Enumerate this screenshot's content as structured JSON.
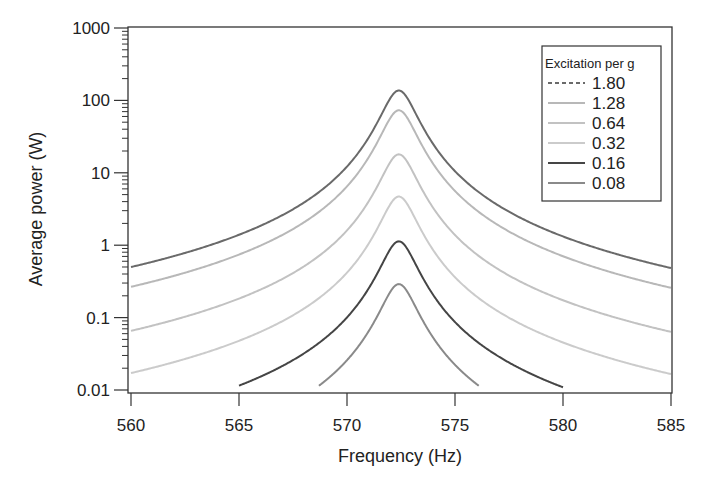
{
  "chart_data": {
    "type": "line",
    "title": "",
    "xlabel": "Frequency (Hz)",
    "ylabel": "Average power (W)",
    "xlim": [
      560,
      585
    ],
    "ylim": [
      0.01,
      1000
    ],
    "yscale": "log",
    "grid": false,
    "xticks": [
      560,
      565,
      570,
      575,
      580,
      585
    ],
    "xtick_labels": [
      "560",
      "565",
      "570",
      "575",
      "580",
      "585"
    ],
    "yticks": [
      0.01,
      0.1,
      1,
      10,
      100,
      1000
    ],
    "ytick_labels": [
      "0.01",
      "0.1",
      "1",
      "10",
      "100",
      "1000"
    ],
    "legend": {
      "title": "Excitation per g",
      "position": "upper right"
    },
    "model": {
      "shape": "lorentzian",
      "center_hz": 572.4,
      "half_width_hz": 0.75
    },
    "series": [
      {
        "name": "1.80",
        "color": "#6a6a6a",
        "dash": "6,4",
        "width": 2,
        "peak_w": 137,
        "f_range": [
          560,
          585
        ],
        "x": [
          560,
          562,
          564,
          566,
          568,
          570,
          571,
          572,
          572.4,
          573,
          574,
          575,
          576,
          578,
          580,
          582,
          585
        ],
        "y": [
          0.5,
          0.71,
          1.08,
          1.86,
          3.87,
          12.2,
          30.6,
          106.7,
          137,
          83.5,
          24.7,
          10.5,
          5.7,
          2.41,
          1.32,
          0.83,
          0.48
        ]
      },
      {
        "name": "1.28",
        "color": "#b8b8b8",
        "dash": "",
        "width": 2,
        "peak_w": 73,
        "f_range": [
          560,
          585
        ],
        "x": [
          560,
          562,
          564,
          566,
          568,
          570,
          571,
          572,
          572.4,
          573,
          574,
          575,
          576,
          578,
          580,
          582,
          585
        ],
        "y": [
          0.27,
          0.38,
          0.58,
          0.99,
          2.06,
          6.5,
          16.3,
          56.9,
          73,
          44.5,
          13.2,
          5.6,
          3.04,
          1.28,
          0.7,
          0.44,
          0.26
        ]
      },
      {
        "name": "0.64",
        "color": "#c2c2c2",
        "dash": "",
        "width": 2,
        "peak_w": 18,
        "f_range": [
          560,
          585
        ],
        "x": [
          560,
          562,
          564,
          566,
          568,
          570,
          571,
          572,
          572.4,
          573,
          574,
          575,
          576,
          578,
          580,
          582,
          585
        ],
        "y": [
          0.066,
          0.093,
          0.14,
          0.24,
          0.51,
          1.6,
          4.0,
          14.0,
          18,
          11.0,
          3.2,
          1.38,
          0.75,
          0.32,
          0.17,
          0.11,
          0.063
        ]
      },
      {
        "name": "0.32",
        "color": "#cbcbcb",
        "dash": "",
        "width": 2,
        "peak_w": 4.7,
        "f_range": [
          560,
          585
        ],
        "x": [
          560,
          562,
          564,
          566,
          568,
          570,
          571,
          572,
          572.4,
          573,
          574,
          575,
          576,
          578,
          580,
          582,
          585
        ],
        "y": [
          0.017,
          0.024,
          0.037,
          0.064,
          0.13,
          0.42,
          1.05,
          3.66,
          4.7,
          2.86,
          0.85,
          0.36,
          0.2,
          0.083,
          0.045,
          0.028,
          0.016
        ]
      },
      {
        "name": "0.16",
        "color": "#454545",
        "dash": "",
        "width": 2,
        "peak_w": 1.13,
        "f_range": [
          565,
          580
        ],
        "x": [
          565,
          566,
          568,
          570,
          571,
          572,
          572.4,
          573,
          574,
          575,
          576,
          578,
          580
        ],
        "y": [
          0.0115,
          0.0155,
          0.032,
          0.1,
          0.25,
          0.88,
          1.13,
          0.69,
          0.2,
          0.087,
          0.047,
          0.02,
          0.011
        ]
      },
      {
        "name": "0.08",
        "color": "#8a8a8a",
        "dash": "",
        "width": 2,
        "peak_w": 0.29,
        "f_range": [
          568.7,
          576.1
        ],
        "x": [
          568.7,
          569,
          570,
          571,
          572,
          572.4,
          573,
          574,
          575,
          576,
          576.1
        ],
        "y": [
          0.0115,
          0.0138,
          0.026,
          0.065,
          0.23,
          0.29,
          0.18,
          0.052,
          0.022,
          0.012,
          0.0115
        ]
      }
    ]
  }
}
